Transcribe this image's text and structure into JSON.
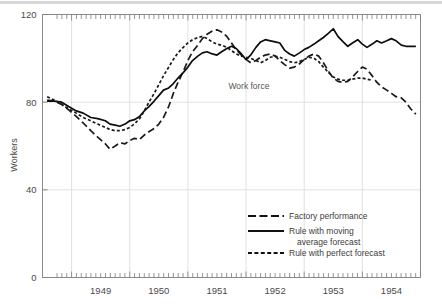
{
  "chart_data": {
    "type": "line",
    "title": "",
    "xlabel": "",
    "ylabel": "Workers",
    "xlim": [
      1948.5,
      1955.0
    ],
    "ylim": [
      0,
      120
    ],
    "yticks": [
      0,
      40,
      80,
      120
    ],
    "ytick_labels": [
      "0",
      "40",
      "80",
      "120"
    ],
    "xticks": [
      1949,
      1950,
      1951,
      1952,
      1953,
      1954
    ],
    "xtick_labels": [
      "1949",
      "1950",
      "1951",
      "1952",
      "1953",
      "1954"
    ],
    "grid": true,
    "grid_color": "#d9d9d9",
    "legend_position": "lower right",
    "annotations": [
      {
        "text": "Work force",
        "x": 1952.05,
        "y": 86
      }
    ],
    "series": [
      {
        "name": "Factory performance",
        "style": "long-dash",
        "color": "#1a1a1a",
        "points": [
          [
            1948.58,
            81.0
          ],
          [
            1948.7,
            80.5
          ],
          [
            1948.83,
            79.0
          ],
          [
            1948.95,
            76.5
          ],
          [
            1949.08,
            73.5
          ],
          [
            1949.2,
            70.5
          ],
          [
            1949.33,
            67.0
          ],
          [
            1949.45,
            64.0
          ],
          [
            1949.58,
            61.0
          ],
          [
            1949.66,
            58.5
          ],
          [
            1949.75,
            60.0
          ],
          [
            1949.83,
            61.5
          ],
          [
            1949.92,
            61.0
          ],
          [
            1950.0,
            62.5
          ],
          [
            1950.08,
            63.5
          ],
          [
            1950.17,
            63.0
          ],
          [
            1950.25,
            65.0
          ],
          [
            1950.33,
            66.5
          ],
          [
            1950.42,
            68.0
          ],
          [
            1950.5,
            70.0
          ],
          [
            1950.58,
            73.0
          ],
          [
            1950.67,
            78.0
          ],
          [
            1950.75,
            84.0
          ],
          [
            1950.83,
            89.0
          ],
          [
            1950.92,
            94.0
          ],
          [
            1951.0,
            99.0
          ],
          [
            1951.08,
            103.0
          ],
          [
            1951.17,
            106.0
          ],
          [
            1951.25,
            109.0
          ],
          [
            1951.33,
            111.0
          ],
          [
            1951.42,
            112.5
          ],
          [
            1951.5,
            113.0
          ],
          [
            1951.58,
            112.0
          ],
          [
            1951.67,
            110.0
          ],
          [
            1951.75,
            107.0
          ],
          [
            1951.83,
            104.0
          ],
          [
            1951.92,
            101.5
          ],
          [
            1952.0,
            99.5
          ],
          [
            1952.08,
            98.0
          ],
          [
            1952.17,
            99.0
          ],
          [
            1952.25,
            100.5
          ],
          [
            1952.33,
            101.5
          ],
          [
            1952.42,
            102.0
          ],
          [
            1952.5,
            101.0
          ],
          [
            1952.58,
            99.0
          ],
          [
            1952.67,
            97.0
          ],
          [
            1952.75,
            95.5
          ],
          [
            1952.83,
            96.0
          ],
          [
            1952.92,
            97.5
          ],
          [
            1953.0,
            99.5
          ],
          [
            1953.08,
            101.0
          ],
          [
            1953.17,
            102.0
          ],
          [
            1953.25,
            101.0
          ],
          [
            1953.33,
            98.0
          ],
          [
            1953.42,
            94.0
          ],
          [
            1953.5,
            91.0
          ],
          [
            1953.58,
            89.5
          ],
          [
            1953.67,
            89.0
          ],
          [
            1953.75,
            89.5
          ],
          [
            1953.83,
            91.5
          ],
          [
            1953.92,
            94.0
          ],
          [
            1954.0,
            96.0
          ],
          [
            1954.08,
            95.0
          ],
          [
            1954.17,
            92.0
          ],
          [
            1954.25,
            89.0
          ],
          [
            1954.33,
            87.0
          ],
          [
            1954.42,
            85.5
          ],
          [
            1954.5,
            84.0
          ],
          [
            1954.58,
            82.5
          ],
          [
            1954.67,
            82.0
          ],
          [
            1954.75,
            80.0
          ],
          [
            1954.83,
            77.0
          ],
          [
            1954.92,
            74.5
          ]
        ]
      },
      {
        "name": "Rule with moving average forecast",
        "style": "solid",
        "color": "#0d0d0d",
        "points": [
          [
            1948.58,
            80.5
          ],
          [
            1948.7,
            80.5
          ],
          [
            1948.83,
            80.0
          ],
          [
            1948.95,
            78.0
          ],
          [
            1949.08,
            76.0
          ],
          [
            1949.2,
            75.0
          ],
          [
            1949.33,
            73.0
          ],
          [
            1949.45,
            72.5
          ],
          [
            1949.58,
            71.5
          ],
          [
            1949.66,
            70.0
          ],
          [
            1949.75,
            69.5
          ],
          [
            1949.83,
            69.0
          ],
          [
            1949.92,
            70.0
          ],
          [
            1950.0,
            71.5
          ],
          [
            1950.08,
            72.0
          ],
          [
            1950.17,
            73.5
          ],
          [
            1950.25,
            76.0
          ],
          [
            1950.33,
            78.0
          ],
          [
            1950.42,
            80.5
          ],
          [
            1950.5,
            83.0
          ],
          [
            1950.58,
            85.5
          ],
          [
            1950.67,
            86.5
          ],
          [
            1950.75,
            88.5
          ],
          [
            1950.83,
            91.0
          ],
          [
            1950.92,
            93.5
          ],
          [
            1951.0,
            96.0
          ],
          [
            1951.08,
            99.0
          ],
          [
            1951.17,
            101.0
          ],
          [
            1951.25,
            102.5
          ],
          [
            1951.33,
            103.0
          ],
          [
            1951.42,
            102.0
          ],
          [
            1951.5,
            101.5
          ],
          [
            1951.58,
            103.0
          ],
          [
            1951.67,
            104.5
          ],
          [
            1951.75,
            105.5
          ],
          [
            1951.83,
            104.5
          ],
          [
            1951.92,
            102.0
          ],
          [
            1952.0,
            99.5
          ],
          [
            1952.08,
            101.5
          ],
          [
            1952.17,
            105.0
          ],
          [
            1952.25,
            107.5
          ],
          [
            1952.33,
            108.5
          ],
          [
            1952.42,
            108.0
          ],
          [
            1952.5,
            107.5
          ],
          [
            1952.58,
            107.0
          ],
          [
            1952.67,
            103.5
          ],
          [
            1952.75,
            102.0
          ],
          [
            1952.83,
            101.0
          ],
          [
            1952.92,
            102.5
          ],
          [
            1953.0,
            104.0
          ],
          [
            1953.08,
            105.0
          ],
          [
            1953.17,
            106.5
          ],
          [
            1953.25,
            108.0
          ],
          [
            1953.33,
            109.5
          ],
          [
            1953.42,
            111.5
          ],
          [
            1953.5,
            113.5
          ],
          [
            1953.58,
            110.0
          ],
          [
            1953.67,
            107.5
          ],
          [
            1953.75,
            105.5
          ],
          [
            1953.83,
            107.0
          ],
          [
            1953.92,
            108.5
          ],
          [
            1954.0,
            106.5
          ],
          [
            1954.08,
            105.0
          ],
          [
            1954.17,
            106.5
          ],
          [
            1954.25,
            108.0
          ],
          [
            1954.33,
            107.0
          ],
          [
            1954.42,
            108.0
          ],
          [
            1954.5,
            109.0
          ],
          [
            1954.58,
            108.0
          ],
          [
            1954.67,
            106.0
          ],
          [
            1954.75,
            105.5
          ],
          [
            1954.83,
            105.5
          ],
          [
            1954.92,
            105.5
          ]
        ]
      },
      {
        "name": "Rule with perfect forecast",
        "style": "short-dash",
        "color": "#1a1a1a",
        "points": [
          [
            1948.58,
            82.5
          ],
          [
            1948.7,
            81.0
          ],
          [
            1948.83,
            79.0
          ],
          [
            1948.95,
            77.0
          ],
          [
            1949.08,
            75.0
          ],
          [
            1949.2,
            73.0
          ],
          [
            1949.33,
            71.5
          ],
          [
            1949.45,
            70.0
          ],
          [
            1949.58,
            68.5
          ],
          [
            1949.66,
            67.5
          ],
          [
            1949.75,
            67.0
          ],
          [
            1949.83,
            67.0
          ],
          [
            1949.92,
            67.5
          ],
          [
            1950.0,
            68.5
          ],
          [
            1950.08,
            70.0
          ],
          [
            1950.17,
            72.5
          ],
          [
            1950.25,
            76.0
          ],
          [
            1950.33,
            80.0
          ],
          [
            1950.42,
            84.0
          ],
          [
            1950.5,
            88.0
          ],
          [
            1950.58,
            92.0
          ],
          [
            1950.67,
            96.0
          ],
          [
            1950.75,
            99.5
          ],
          [
            1950.83,
            102.5
          ],
          [
            1950.92,
            105.0
          ],
          [
            1951.0,
            107.0
          ],
          [
            1951.08,
            108.5
          ],
          [
            1951.17,
            109.5
          ],
          [
            1951.25,
            110.0
          ],
          [
            1951.33,
            109.0
          ],
          [
            1951.42,
            107.5
          ],
          [
            1951.5,
            106.5
          ],
          [
            1951.58,
            106.0
          ],
          [
            1951.67,
            105.0
          ],
          [
            1951.75,
            103.5
          ],
          [
            1951.83,
            102.0
          ],
          [
            1951.92,
            101.0
          ],
          [
            1952.0,
            100.5
          ],
          [
            1952.08,
            100.0
          ],
          [
            1952.17,
            99.0
          ],
          [
            1952.25,
            98.0
          ],
          [
            1952.33,
            99.0
          ],
          [
            1952.42,
            100.5
          ],
          [
            1952.5,
            101.0
          ],
          [
            1952.58,
            100.5
          ],
          [
            1952.67,
            99.5
          ],
          [
            1952.75,
            98.5
          ],
          [
            1952.83,
            98.0
          ],
          [
            1952.92,
            98.5
          ],
          [
            1953.0,
            99.5
          ],
          [
            1953.08,
            100.5
          ],
          [
            1953.17,
            100.0
          ],
          [
            1953.25,
            98.5
          ],
          [
            1953.33,
            96.0
          ],
          [
            1953.42,
            93.5
          ],
          [
            1953.5,
            91.5
          ],
          [
            1953.58,
            90.5
          ],
          [
            1953.67,
            90.0
          ],
          [
            1953.75,
            90.0
          ],
          [
            1953.83,
            90.5
          ],
          [
            1953.92,
            91.0
          ],
          [
            1954.0,
            91.0
          ],
          [
            1954.08,
            90.5
          ],
          [
            1954.17,
            90.0
          ]
        ]
      }
    ]
  },
  "legend": {
    "items": [
      {
        "label": "Factory performance",
        "style": "long-dash"
      },
      {
        "label": "Rule with moving",
        "label2": "average forecast",
        "style": "solid"
      },
      {
        "label": "Rule with perfect forecast",
        "style": "short-dash"
      }
    ]
  }
}
